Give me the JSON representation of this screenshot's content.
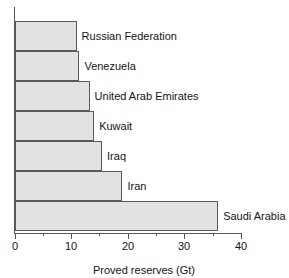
{
  "chart_data": {
    "type": "bar",
    "orientation": "horizontal",
    "title": "",
    "xlabel": "Proved reserves (Gt)",
    "ylabel": "",
    "xlim": [
      0,
      40
    ],
    "xticks": [
      0,
      10,
      20,
      30,
      40
    ],
    "xtick_labels": [
      "0",
      "10",
      "20",
      "30",
      "40"
    ],
    "minor_xticks": [
      5,
      15,
      25,
      35
    ],
    "grid": false,
    "legend": null,
    "bar_fill_color": "#e2e2e2",
    "bar_edge_color": "#5a5a5a",
    "axis_color": "#555555",
    "background_color": "#ffffff",
    "categories": [
      "Russian Federation",
      "Venezuela",
      "United Arab Emirates",
      "Kuwait",
      "Iraq",
      "Iran",
      "Saudi Arabia"
    ],
    "values": [
      10.7,
      11.2,
      13.0,
      13.8,
      15.2,
      18.8,
      35.7
    ],
    "bars": [
      {
        "label": "Russian Federation",
        "value": 10.7
      },
      {
        "label": "Venezuela",
        "value": 11.2
      },
      {
        "label": "United Arab Emirates",
        "value": 13.0
      },
      {
        "label": "Kuwait",
        "value": 13.8
      },
      {
        "label": "Iraq",
        "value": 15.2
      },
      {
        "label": "Iran",
        "value": 18.8
      },
      {
        "label": "Saudi Arabia",
        "value": 35.7
      }
    ]
  }
}
